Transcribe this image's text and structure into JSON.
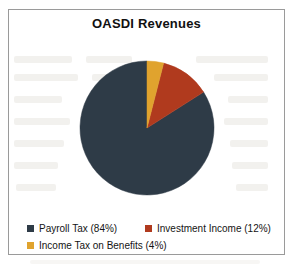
{
  "chart": {
    "title": "OASDI Revenues"
  },
  "legend": {
    "rows": [
      [
        {
          "label": "Payroll Tax (84%)",
          "color": "#2e3b47",
          "swatch_icon": "square-swatch-icon"
        },
        {
          "label": "Investment Income (12%)",
          "color": "#b03a1e",
          "swatch_icon": "square-swatch-icon"
        }
      ],
      [
        {
          "label": "Income Tax on Benefits (4%)",
          "color": "#e0a32e",
          "swatch_icon": "square-swatch-icon"
        }
      ]
    ]
  },
  "chart_data": {
    "type": "pie",
    "title": "OASDI Revenues",
    "xlabel": "",
    "ylabel": "",
    "legend_position": "bottom-left",
    "grid": false,
    "start_angle_deg": 0,
    "direction": "counterclockwise",
    "categories": [
      "Payroll Tax",
      "Investment Income",
      "Income Tax on Benefits"
    ],
    "values": [
      84,
      12,
      4
    ],
    "value_unit": "percent",
    "colors": [
      "#2e3b47",
      "#b03a1e",
      "#e0a32e"
    ],
    "slices": [
      {
        "label": "Payroll Tax",
        "value": 84,
        "display": "Payroll Tax (84%)",
        "color": "#2e3b47"
      },
      {
        "label": "Investment Income",
        "value": 12,
        "display": "Investment Income (12%)",
        "color": "#b03a1e"
      },
      {
        "label": "Income Tax on Benefits",
        "value": 4,
        "display": "Income Tax on Benefits (4%)",
        "color": "#e0a32e"
      }
    ]
  },
  "geometry": {
    "pie_center_x": 75,
    "pie_center_y": 84,
    "pie_radius": 67
  }
}
